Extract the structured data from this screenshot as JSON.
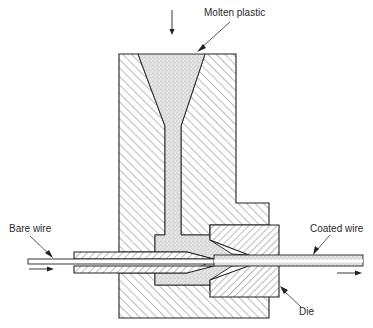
{
  "diagram": {
    "labels": {
      "molten_plastic": "Molten plastic",
      "bare_wire": "Bare wire",
      "coated_wire": "Coated wire",
      "die": "Die"
    },
    "flow_arrows": [
      {
        "name": "plastic-feed-arrow",
        "direction": "down"
      },
      {
        "name": "wire-in-arrow",
        "direction": "right"
      },
      {
        "name": "wire-out-arrow",
        "direction": "right"
      }
    ],
    "colors": {
      "line": "#222222",
      "background": "#ffffff",
      "plastic_fill": "#d8d8d8"
    }
  }
}
